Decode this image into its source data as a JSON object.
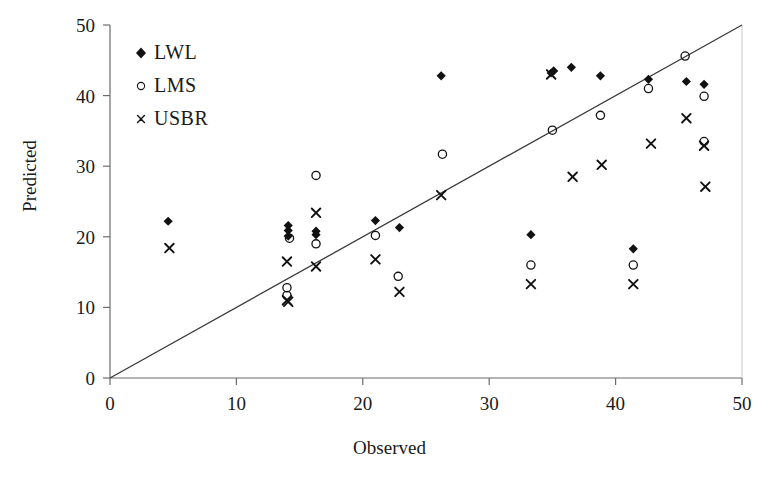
{
  "chart_data": {
    "type": "scatter",
    "title": "",
    "xlabel": "Observed",
    "ylabel": "Predicted",
    "xlim": [
      0,
      50
    ],
    "ylim": [
      0,
      50
    ],
    "xticks": [
      0,
      10,
      20,
      30,
      40,
      50
    ],
    "yticks": [
      0,
      10,
      20,
      30,
      40,
      50
    ],
    "grid": false,
    "legend_position": "top-left",
    "reference_line": {
      "name": "1:1 line",
      "from": [
        0,
        0
      ],
      "to": [
        50,
        50
      ]
    },
    "series": [
      {
        "name": "LWL",
        "marker": "filled-diamond",
        "color": "#111111",
        "points": [
          [
            4.6,
            22.2
          ],
          [
            14.1,
            21.6
          ],
          [
            14.1,
            20.9
          ],
          [
            14.1,
            20.1
          ],
          [
            16.3,
            20.8
          ],
          [
            16.3,
            20.3
          ],
          [
            21.0,
            22.3
          ],
          [
            22.9,
            21.3
          ],
          [
            26.2,
            42.8
          ],
          [
            33.3,
            20.3
          ],
          [
            34.9,
            43.2
          ],
          [
            35.1,
            43.5
          ],
          [
            36.5,
            44.0
          ],
          [
            38.8,
            42.8
          ],
          [
            41.4,
            18.3
          ],
          [
            42.6,
            42.3
          ],
          [
            45.6,
            42.0
          ],
          [
            47.0,
            41.6
          ]
        ]
      },
      {
        "name": "LMS",
        "marker": "open-circle",
        "color": "#111111",
        "points": [
          [
            14.0,
            12.8
          ],
          [
            14.0,
            11.7
          ],
          [
            14.2,
            19.8
          ],
          [
            16.3,
            28.7
          ],
          [
            16.3,
            19.0
          ],
          [
            21.0,
            20.2
          ],
          [
            22.8,
            14.4
          ],
          [
            26.3,
            31.7
          ],
          [
            33.3,
            16.0
          ],
          [
            35.0,
            35.1
          ],
          [
            38.8,
            37.2
          ],
          [
            41.4,
            16.0
          ],
          [
            42.6,
            41.0
          ],
          [
            45.5,
            45.6
          ],
          [
            47.0,
            39.9
          ],
          [
            47.0,
            33.5
          ]
        ]
      },
      {
        "name": "USBR",
        "marker": "cross-x",
        "color": "#111111",
        "points": [
          [
            4.7,
            18.4
          ],
          [
            14.0,
            16.5
          ],
          [
            14.0,
            11.0
          ],
          [
            14.1,
            10.8
          ],
          [
            16.3,
            23.4
          ],
          [
            16.3,
            15.8
          ],
          [
            21.0,
            16.8
          ],
          [
            22.9,
            12.2
          ],
          [
            26.2,
            25.9
          ],
          [
            33.3,
            13.3
          ],
          [
            34.9,
            43.0
          ],
          [
            36.6,
            28.5
          ],
          [
            38.9,
            30.2
          ],
          [
            41.4,
            13.3
          ],
          [
            42.8,
            33.2
          ],
          [
            45.6,
            36.8
          ],
          [
            47.0,
            32.9
          ],
          [
            47.1,
            27.1
          ]
        ]
      }
    ]
  },
  "legend": {
    "items": [
      {
        "label": "LWL",
        "marker": "filled-diamond"
      },
      {
        "label": "LMS",
        "marker": "open-circle"
      },
      {
        "label": "USBR",
        "marker": "cross-x"
      }
    ]
  },
  "axes": {
    "x_label": "Observed",
    "y_label": "Predicted",
    "x_tick_labels": [
      "0",
      "10",
      "20",
      "30",
      "40",
      "50"
    ],
    "y_tick_labels": [
      "0",
      "10",
      "20",
      "30",
      "40",
      "50"
    ]
  },
  "colors": {
    "marker": "#111111",
    "axis": "#6b6b6b",
    "line": "#3a3a3a",
    "text": "#1a1a1a",
    "background": "#ffffff"
  }
}
